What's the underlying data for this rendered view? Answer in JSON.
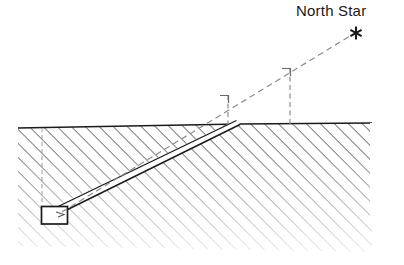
{
  "figure": {
    "type": "cross-section-diagram",
    "background_color": "#ffffff",
    "ink_color": "#1a1a1a",
    "hatch_color": "#5a5a5a",
    "labels": {
      "north_star": "North Star"
    },
    "glyphs": {
      "star_symbol": "✱"
    },
    "elements": {
      "ground_region_name": "hatched-bedrock",
      "shaft_name": "descending-shaft",
      "chamber_name": "burial-chamber",
      "sight_line_name": "star-sight-line"
    },
    "geometry": {
      "ground_surface": {
        "left_x": 18,
        "left_y": 128,
        "right_x": 372,
        "right_y": 123
      },
      "shaft_mouth": {
        "x": 240,
        "y": 124
      },
      "chamber": {
        "x": 41,
        "y": 206,
        "width": 27,
        "height": 18
      },
      "star_point": {
        "x": 356,
        "y": 33
      },
      "drop_line_left_x": 228,
      "drop_line_right_x": 290,
      "vertical_depth_line_x": 42,
      "hatch_angle_deg": 45,
      "hatch_spacing_px": 7
    }
  }
}
